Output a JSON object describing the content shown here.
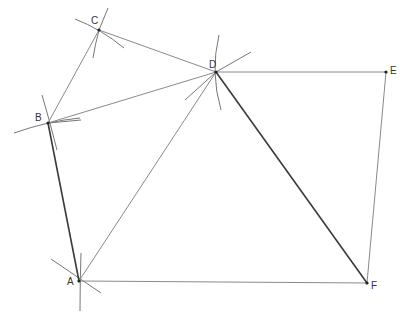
{
  "diagram": {
    "title": "",
    "points": [
      {
        "id": "A",
        "label": "A",
        "x": 79,
        "y": 281,
        "label_dx": -12,
        "label_dy": 4
      },
      {
        "id": "B",
        "label": "B",
        "x": 48,
        "y": 123,
        "label_dx": -13,
        "label_dy": -2
      },
      {
        "id": "C",
        "label": "C",
        "x": 99,
        "y": 30,
        "label_dx": -8,
        "label_dy": -6
      },
      {
        "id": "D",
        "label": "D",
        "x": 216,
        "y": 72,
        "label_dx": -7,
        "label_dy": -4
      },
      {
        "id": "E",
        "label": "E",
        "x": 386,
        "y": 72,
        "label_dx": 4,
        "label_dy": 2
      },
      {
        "id": "F",
        "label": "F",
        "x": 367,
        "y": 283,
        "label_dx": 4,
        "label_dy": 6
      }
    ],
    "segments": [
      {
        "from": "A",
        "to": "B",
        "style": "dark"
      },
      {
        "from": "B",
        "to": "C",
        "style": "thin"
      },
      {
        "from": "C",
        "to": "D",
        "style": "thin"
      },
      {
        "from": "B",
        "to": "D",
        "style": "thin"
      },
      {
        "from": "A",
        "to": "D",
        "style": "thin"
      },
      {
        "from": "D",
        "to": "E",
        "style": "thin"
      },
      {
        "from": "E",
        "to": "F",
        "style": "thin"
      },
      {
        "from": "A",
        "to": "F",
        "style": "thin"
      },
      {
        "from": "D",
        "to": "F",
        "style": "dark"
      }
    ],
    "construction_marks": [
      {
        "near": "A",
        "path": "M51 259 L101 293"
      },
      {
        "near": "A",
        "path": "M81 253 Q80 282 80 311"
      },
      {
        "near": "B",
        "path": "M14 133 Q48 121 80 118"
      },
      {
        "near": "B",
        "path": "M42 95 Q50 122 57 150"
      },
      {
        "near": "B",
        "path": "M48 123 L81 120"
      },
      {
        "near": "C",
        "path": "M75 19 Q101 29 124 48"
      },
      {
        "near": "C",
        "path": "M108 8 L99 30"
      },
      {
        "near": "C",
        "path": "M99 30 Q95 45 93 58"
      },
      {
        "near": "D",
        "path": "M219 35 Q210 72 221 110"
      },
      {
        "near": "D",
        "path": "M216 72 L251 52"
      },
      {
        "near": "D",
        "path": "M216 72 L185 100"
      }
    ]
  }
}
